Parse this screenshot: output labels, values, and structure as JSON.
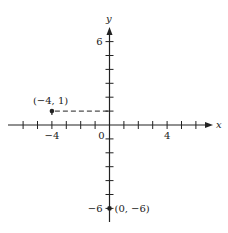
{
  "chart_data": {
    "type": "scatter",
    "title": "",
    "xlabel": "x",
    "ylabel": "y",
    "xlim": [
      -7,
      7
    ],
    "ylim": [
      -7,
      7
    ],
    "x_tick_labels": [
      {
        "value": -4,
        "label": "−4"
      },
      {
        "value": 0,
        "label": "0"
      },
      {
        "value": 4,
        "label": "4"
      }
    ],
    "y_tick_labels": [
      {
        "value": 6,
        "label": "6"
      },
      {
        "value": -6,
        "label": "−6"
      }
    ],
    "tick_interval": 1,
    "grid": false,
    "points": [
      {
        "x": -4,
        "y": 1,
        "label": "(−4, 1)",
        "guide": "dashed horizontal line to y-axis"
      },
      {
        "x": 0,
        "y": -6,
        "label": "(0, −6)"
      }
    ]
  },
  "colors": {
    "ink": "#222222",
    "background": "#ffffff"
  }
}
